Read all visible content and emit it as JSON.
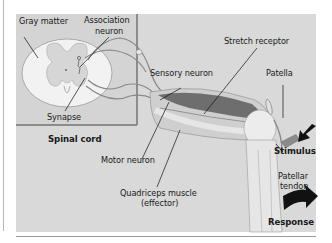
{
  "figure": {
    "type": "knee-jerk reflex arc diagram",
    "colors": {
      "background": "#ffffff",
      "panel": "#d9d9d9",
      "inset_panel": "#d4d4d4",
      "inset_border": "#8c8c8c",
      "tissue_light": "#ececec",
      "muscle": "#6e6e6e",
      "arrow": "#111111",
      "label_text": "#1a1a1a"
    },
    "labels": {
      "gray_matter": "Gray matter",
      "association_neuron_1": "Association",
      "association_neuron_2": "neuron",
      "synapse": "Synapse",
      "spinal_cord": "Spinal cord",
      "sensory_neuron": "Sensory neuron",
      "stretch_receptor": "Stretch receptor",
      "patella": "Patella",
      "motor_neuron": "Motor neuron",
      "quadriceps_1": "Quadriceps muscle",
      "quadriceps_2": "(effector)",
      "stimulus": "Stimulus",
      "patellar_tendon_1": "Patellar",
      "patellar_tendon_2": "tendon",
      "response": "Response"
    },
    "arrows": [
      {
        "name": "stimulus-arrow",
        "direction": "down-left"
      },
      {
        "name": "response-arrow",
        "direction": "right"
      }
    ]
  }
}
